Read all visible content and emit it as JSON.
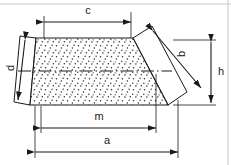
{
  "diagram": {
    "type": "engineering-dimension-diagram",
    "colors": {
      "outline": "#1a1a1a",
      "dimension_line": "#1a1a1a",
      "fill_background": "#ffffff",
      "stipple_dot": "#2b2b2b",
      "frame_line": "#c8c8c8",
      "centerline": "#1a1a1a",
      "label_text": "#1a1a1a"
    },
    "frame": {
      "top_rule_y": 4,
      "right_rule_x": 228
    },
    "shape": {
      "name": "stippled-trapezoid",
      "fill_pattern": "stipple-dots",
      "vertices": [
        {
          "name": "top-left",
          "x": 36,
          "y": 38
        },
        {
          "name": "top-right",
          "x": 133,
          "y": 38
        },
        {
          "name": "bottom-right",
          "x": 168,
          "y": 105
        },
        {
          "name": "bottom-left",
          "x": 30,
          "y": 105
        }
      ]
    },
    "left_flank": {
      "name": "left-slanted-panel",
      "fill": "none",
      "vertices": [
        {
          "x": 20,
          "y": 36
        },
        {
          "x": 36,
          "y": 38
        },
        {
          "x": 30,
          "y": 105
        },
        {
          "x": 14,
          "y": 102
        }
      ]
    },
    "right_flank": {
      "name": "right-slanted-panel",
      "fill": "none",
      "vertices": [
        {
          "x": 133,
          "y": 38
        },
        {
          "x": 152,
          "y": 26
        },
        {
          "x": 187,
          "y": 92
        },
        {
          "x": 168,
          "y": 105
        }
      ]
    },
    "centerline": {
      "name": "horizontal-centerline",
      "style": "dash-dot",
      "y": 71,
      "x_start": 18,
      "x_end": 172
    },
    "dimensions": [
      {
        "id": "c",
        "label": "c",
        "orientation": "horizontal",
        "description": "top-width-dimension",
        "line_y": 22,
        "from_x": 44,
        "to_x": 131,
        "label_x": 88,
        "label_y": 12,
        "extension_from": {
          "x": 44,
          "y": 22,
          "to_y": 38
        },
        "extension_to": {
          "x": 131,
          "y": 15,
          "to_y": 38
        }
      },
      {
        "id": "m",
        "label": "m",
        "orientation": "horizontal",
        "description": "mid-width-dimension",
        "line_y": 128,
        "from_x": 41,
        "to_x": 156,
        "label_x": 99,
        "label_y": 117
      },
      {
        "id": "a",
        "label": "a",
        "orientation": "horizontal",
        "description": "overall-bottom-width-dimension",
        "line_y": 152,
        "from_x": 35,
        "to_x": 178,
        "label_x": 107,
        "label_y": 141
      },
      {
        "id": "h",
        "label": "h",
        "orientation": "vertical",
        "description": "overall-height-dimension",
        "line_x": 211,
        "from_y": 44,
        "to_y": 104,
        "label_x": 221,
        "label_y": 72
      },
      {
        "id": "d",
        "label": "d",
        "orientation": "diagonal",
        "description": "left-slant-edge-dimension",
        "from": {
          "x": 25,
          "y": 40
        },
        "to": {
          "x": 18,
          "y": 100
        },
        "label_x": 13,
        "label_y": 68,
        "label_rotation": -90
      },
      {
        "id": "b",
        "label": "b",
        "orientation": "diagonal",
        "description": "right-slant-edge-dimension",
        "from": {
          "x": 153,
          "y": 31
        },
        "to": {
          "x": 201,
          "y": 88
        },
        "label_x": 181,
        "label_y": 55,
        "label_rotation": -90
      }
    ]
  }
}
